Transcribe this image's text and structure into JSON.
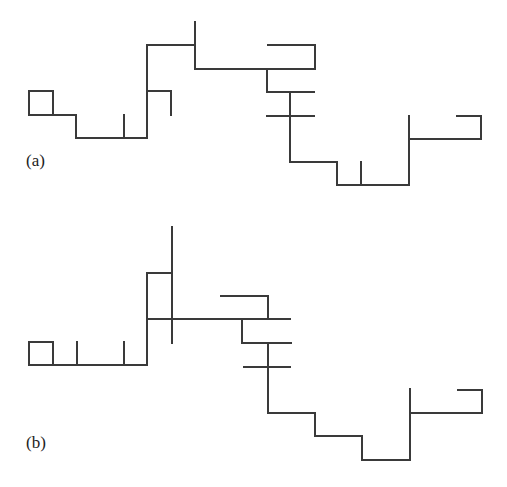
{
  "figure": {
    "stroke_color": "#3a3a3a",
    "background": "#ffffff",
    "panels": [
      {
        "id": "a",
        "label": "(a)",
        "label_pos": [
          26,
          151
        ],
        "segments": [
          [
            29,
            91,
            53,
            91
          ],
          [
            53,
            91,
            53,
            115
          ],
          [
            29,
            115,
            53,
            115
          ],
          [
            29,
            91,
            29,
            115
          ],
          [
            53,
            115,
            76,
            115
          ],
          [
            76,
            115,
            76,
            138
          ],
          [
            76,
            138,
            147,
            138
          ],
          [
            124,
            115,
            124,
            138
          ],
          [
            147,
            138,
            147,
            45
          ],
          [
            147,
            91,
            171,
            91
          ],
          [
            171,
            91,
            171,
            115
          ],
          [
            147,
            45,
            195,
            45
          ],
          [
            195,
            22,
            195,
            69
          ],
          [
            195,
            69,
            315,
            69
          ],
          [
            268,
            45,
            315,
            45
          ],
          [
            315,
            45,
            315,
            69
          ],
          [
            267,
            69,
            267,
            92
          ],
          [
            267,
            92,
            314,
            92
          ],
          [
            290,
            92,
            290,
            162
          ],
          [
            267,
            116,
            314,
            116
          ],
          [
            290,
            162,
            337,
            162
          ],
          [
            337,
            162,
            337,
            185
          ],
          [
            337,
            185,
            409,
            185
          ],
          [
            361,
            162,
            361,
            185
          ],
          [
            409,
            185,
            409,
            116
          ],
          [
            409,
            139,
            481,
            139
          ],
          [
            481,
            139,
            481,
            116
          ],
          [
            457,
            116,
            481,
            116
          ]
        ]
      },
      {
        "id": "b",
        "label": "(b)",
        "label_pos": [
          26,
          433
        ],
        "segments": [
          [
            29,
            342,
            53,
            342
          ],
          [
            53,
            342,
            53,
            365
          ],
          [
            29,
            342,
            29,
            365
          ],
          [
            29,
            365,
            147,
            365
          ],
          [
            77,
            342,
            77,
            365
          ],
          [
            124,
            342,
            124,
            365
          ],
          [
            147,
            365,
            147,
            273
          ],
          [
            147,
            273,
            172,
            273
          ],
          [
            172,
            227,
            172,
            343
          ],
          [
            147,
            319,
            290,
            319
          ],
          [
            221,
            296,
            268,
            296
          ],
          [
            268,
            296,
            268,
            319
          ],
          [
            242,
            319,
            242,
            343
          ],
          [
            242,
            343,
            291,
            343
          ],
          [
            268,
            343,
            268,
            413
          ],
          [
            244,
            367,
            290,
            367
          ],
          [
            268,
            413,
            315,
            413
          ],
          [
            315,
            413,
            315,
            436
          ],
          [
            315,
            436,
            362,
            436
          ],
          [
            362,
            436,
            362,
            460
          ],
          [
            362,
            460,
            410,
            460
          ],
          [
            410,
            460,
            410,
            389
          ],
          [
            410,
            413,
            482,
            413
          ],
          [
            482,
            413,
            482,
            390
          ],
          [
            458,
            390,
            482,
            390
          ]
        ]
      }
    ]
  }
}
